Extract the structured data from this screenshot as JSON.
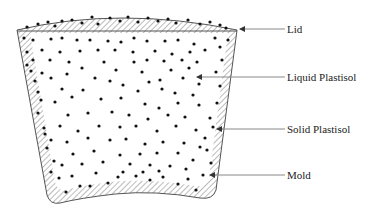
{
  "diagram": {
    "type": "slush-molding cross-section",
    "colors": {
      "outline": "#555555",
      "hatch": "#777777",
      "particle": "#111111",
      "leader": "#888888",
      "text": "#222222",
      "background": "#ffffff"
    },
    "labels": [
      {
        "id": "lid",
        "text": "Lid",
        "x": 287,
        "y": 33,
        "arrow_from": 285,
        "arrow_to": 239,
        "arrow_y": 29
      },
      {
        "id": "liquid-plastisol",
        "text": "Liquid Plastisol",
        "x": 287,
        "y": 81,
        "arrow_from": 285,
        "arrow_to": 196,
        "arrow_y": 77
      },
      {
        "id": "solid-plastisol",
        "text": "Solid Plastisol",
        "x": 287,
        "y": 133,
        "arrow_from": 285,
        "arrow_to": 216,
        "arrow_y": 129
      },
      {
        "id": "mold",
        "text": "Mold",
        "x": 287,
        "y": 179,
        "arrow_from": 285,
        "arrow_to": 209,
        "arrow_y": 175
      }
    ]
  }
}
